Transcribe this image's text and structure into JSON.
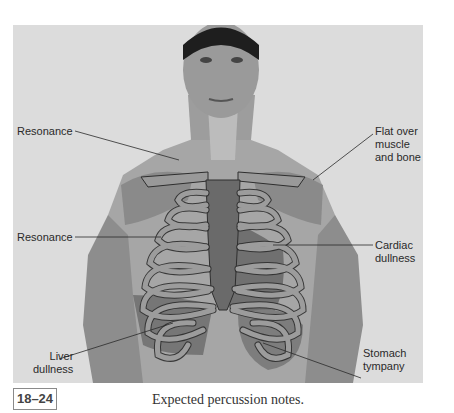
{
  "figure": {
    "number": "18–24",
    "caption": "Expected percussion notes.",
    "labels": {
      "resonance_upper": "Resonance",
      "resonance_lower": "Resonance",
      "flat": "Flat over\nmuscle\nand bone",
      "cardiac": "Cardiac\ndullness",
      "liver": "Liver\ndullness",
      "stomach": "Stomach\ntympany"
    },
    "colors": {
      "background": "#dcdcdc",
      "skin": "#a9a9a9",
      "resonance_zone": "#b8b8b8",
      "flat_zone": "#8c8c8c",
      "dull_zone": "#6f6f6f",
      "bone": "#9a9a9a",
      "bone_outline": "#2e2e2e"
    }
  }
}
